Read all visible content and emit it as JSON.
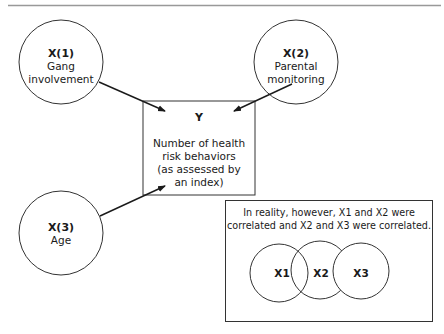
{
  "diagram": {
    "nodes": {
      "x1": {
        "label": "X(1)",
        "lines": [
          "Gang",
          "involvement"
        ]
      },
      "x2": {
        "label": "X(2)",
        "lines": [
          "Parental",
          "monitoring"
        ]
      },
      "x3": {
        "label": "X(3)",
        "lines": [
          "Age"
        ]
      },
      "y": {
        "label": "Y",
        "lines": [
          "Number of health",
          "risk behaviors",
          "(as assessed by",
          "an index)"
        ]
      }
    },
    "edges": [
      {
        "from": "X(1)",
        "to": "Y"
      },
      {
        "from": "X(2)",
        "to": "Y"
      },
      {
        "from": "X(3)",
        "to": "Y"
      }
    ],
    "correlation_box": {
      "lines": [
        "In reality, however, X1 and X2 were",
        "correlated and X2 and X3 were correlated."
      ],
      "venn": [
        "X1",
        "X2",
        "X3"
      ]
    },
    "colors": {
      "stroke": "#333333",
      "text": "#1a1a1a",
      "rule": "#999999"
    }
  }
}
